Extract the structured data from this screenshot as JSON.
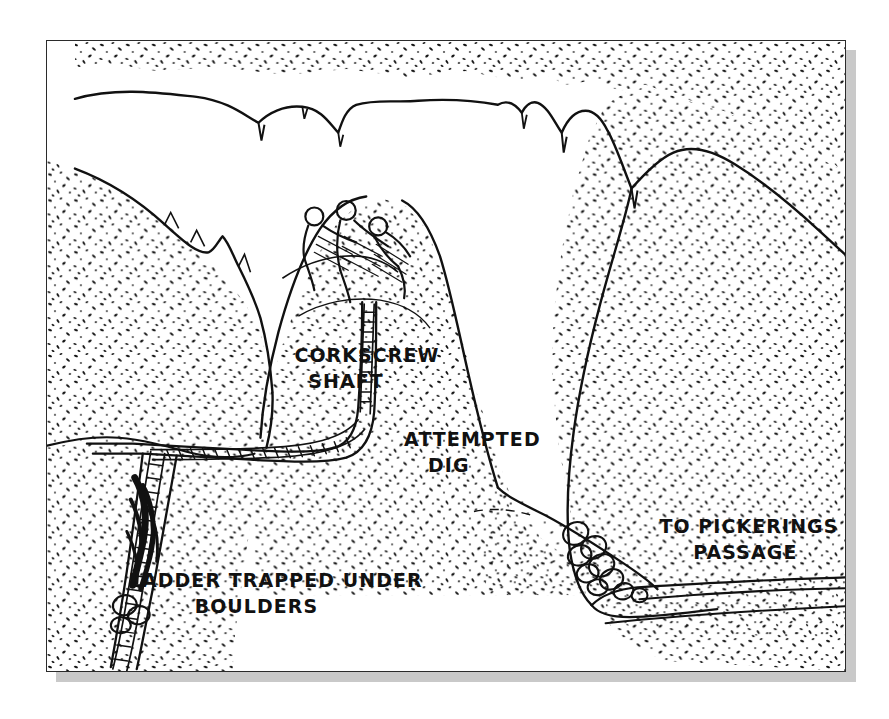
{
  "figure": {
    "kind": "cave-cross-section-line-drawing",
    "title_visible": false,
    "medium": "hand-drawn pen-and-ink survey elevation",
    "frame": {
      "border_color": "#2b2b2b",
      "plate_color": "#ffffff",
      "shadow_color": "#c9c9c9"
    },
    "ink_color": "#111111"
  },
  "labels": [
    {
      "id": "corkscrew-shaft",
      "line1": "CORKSCREW",
      "line2": "SHAFT",
      "x": 283,
      "y": 350
    },
    {
      "id": "attempted-dig",
      "line1": "ATTEMPTED",
      "line2": "DIG",
      "x": 408,
      "y": 440
    },
    {
      "id": "to-pickerings-passage",
      "line1": "TO PICKERINGS",
      "line2": "PASSAGE",
      "x": 655,
      "y": 522
    },
    {
      "id": "ladder-trapped-under-boulders",
      "line1": "LADDER TRAPPED UNDER",
      "line2": "BOULDERS",
      "x": 116,
      "y": 585
    }
  ],
  "features": [
    {
      "id": "cave-ceiling",
      "name": "stippled cave ceiling with stalactites"
    },
    {
      "id": "left-wall",
      "name": "left cave wall, stippled rock"
    },
    {
      "id": "right-wall",
      "name": "right cave wall, stippled rock"
    },
    {
      "id": "central-boulder-mound",
      "name": "central boulder and rubble mound"
    },
    {
      "id": "cavers",
      "name": "three cavers seated on top of the mound"
    },
    {
      "id": "ladder",
      "name": "wire ladder descending the corkscrew shaft"
    },
    {
      "id": "boulder-chain",
      "name": "chain of rounded boulders on the right slope"
    },
    {
      "id": "cave-floor",
      "name": "stippled cave floor leading off to the right"
    }
  ]
}
